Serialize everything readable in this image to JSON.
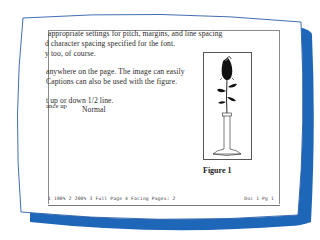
{
  "colors": {
    "screen_bg": "#ffffff",
    "bezel_shadow": "#1e66b8",
    "bezel_outline": "#2c5fa8",
    "text": "#2a2a2a"
  },
  "document": {
    "lines": [
      " appropriate settings for pitch, margins, and line spacing",
      "d character spacing specified for the font.",
      "y too, of course.",
      "anywhere on the page. The image can easily",
      " Captions can also be used with the figure.",
      "t up or down 1/2 line.",
      "ance up",
      "Normal"
    ]
  },
  "figure": {
    "image_icon": "rose-in-vase-image",
    "caption": "Figure 1"
  },
  "status_bar": {
    "view_options": "1 100%  2 200%  3 Full Page  4 Facing Pages: 2",
    "position": "Doc 1 Pg 1"
  }
}
